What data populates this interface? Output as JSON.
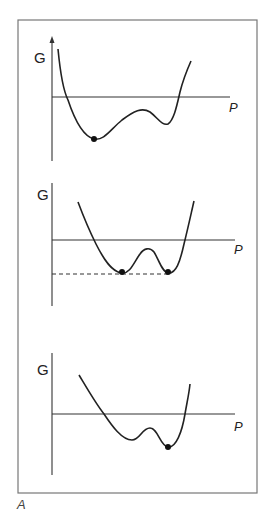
{
  "figure": {
    "caption_label": "A",
    "frame_color": "#777777",
    "line_color": "#222222",
    "panels": [
      {
        "y_label": "G",
        "x_label": "P",
        "y_axis_arrow": true,
        "description": "Global minimum at low P, metastable local minimum at higher P",
        "minima": [
          {
            "type": "global",
            "marked": true
          },
          {
            "type": "local",
            "marked": false
          }
        ]
      },
      {
        "y_label": "G",
        "x_label": "P",
        "y_axis_arrow": false,
        "description": "Two equal-depth minima, both marked, joined by dashed level line",
        "minima": [
          {
            "type": "global",
            "marked": true
          },
          {
            "type": "global",
            "marked": true
          }
        ]
      },
      {
        "y_label": "G",
        "x_label": "P",
        "y_axis_arrow": false,
        "description": "Local minimum at low P, global minimum at higher P",
        "minima": [
          {
            "type": "local",
            "marked": false
          },
          {
            "type": "global",
            "marked": true
          }
        ]
      }
    ]
  }
}
